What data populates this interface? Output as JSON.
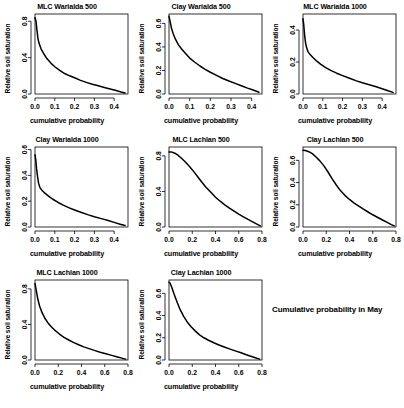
{
  "figure": {
    "caption": "Cumulative probability in May",
    "caption_position": {
      "left": 272,
      "top": 305
    },
    "width": 404,
    "height": 408,
    "background": "#ffffff",
    "line_color": "#000000",
    "axis_color": "#000000"
  },
  "common": {
    "xlabel": "cumulative probability",
    "ylabel": "Relative soil saturation"
  },
  "chart_data": [
    {
      "type": "line",
      "title": "MLC Warialda 500",
      "xlabel": "cumulative probability",
      "ylabel": "Relative soil saturation",
      "xlim": [
        0.0,
        0.47
      ],
      "ylim": [
        0.0,
        0.88
      ],
      "xticks": [
        0.0,
        0.1,
        0.2,
        0.3,
        0.4
      ],
      "xticklabels": [
        "0.0",
        "0.1",
        "0.2",
        "0.3",
        "0.4"
      ],
      "yticks": [
        0.0,
        0.4,
        0.8
      ],
      "yticklabels": [
        "0.0",
        "0.4",
        "0.8"
      ],
      "grid": false,
      "legend": "none",
      "x": [
        0.0,
        0.005,
        0.01,
        0.015,
        0.02,
        0.03,
        0.045,
        0.06,
        0.08,
        0.1,
        0.125,
        0.15,
        0.175,
        0.2,
        0.23,
        0.26,
        0.29,
        0.32,
        0.35,
        0.38,
        0.41,
        0.435,
        0.455
      ],
      "y": [
        0.84,
        0.8,
        0.7,
        0.61,
        0.56,
        0.5,
        0.44,
        0.39,
        0.34,
        0.3,
        0.26,
        0.225,
        0.2,
        0.178,
        0.15,
        0.128,
        0.108,
        0.09,
        0.072,
        0.055,
        0.038,
        0.022,
        0.012
      ]
    },
    {
      "type": "line",
      "title": "Clay Warialda 500",
      "xlabel": "cumulative probability",
      "ylabel": "Relative soil saturation",
      "xlim": [
        0.0,
        0.45
      ],
      "ylim": [
        0.0,
        0.68
      ],
      "xticks": [
        0.0,
        0.1,
        0.2,
        0.3,
        0.4
      ],
      "xticklabels": [
        "0.0",
        "0.1",
        "0.2",
        "0.3",
        "0.4"
      ],
      "yticks": [
        0.0,
        0.2,
        0.4,
        0.6
      ],
      "yticklabels": [
        "0.0",
        "0.2",
        "0.4",
        "0.6"
      ],
      "grid": false,
      "legend": "none",
      "x": [
        0.0,
        0.005,
        0.012,
        0.02,
        0.03,
        0.045,
        0.06,
        0.08,
        0.1,
        0.125,
        0.15,
        0.175,
        0.2,
        0.23,
        0.26,
        0.29,
        0.32,
        0.35,
        0.38,
        0.4,
        0.42,
        0.435
      ],
      "y": [
        0.66,
        0.62,
        0.56,
        0.515,
        0.47,
        0.42,
        0.385,
        0.345,
        0.305,
        0.27,
        0.238,
        0.21,
        0.185,
        0.158,
        0.132,
        0.11,
        0.09,
        0.07,
        0.05,
        0.038,
        0.025,
        0.015
      ]
    },
    {
      "type": "line",
      "title": "MLC Warialda 1000",
      "xlabel": "cumulative probability",
      "ylabel": "Relative soil saturation",
      "xlim": [
        0.0,
        0.47
      ],
      "ylim": [
        0.0,
        0.5
      ],
      "xticks": [
        0.0,
        0.1,
        0.2,
        0.3,
        0.4
      ],
      "xticklabels": [
        "0.0",
        "0.1",
        "0.2",
        "0.3",
        "0.4"
      ],
      "yticks": [
        0.0,
        0.2,
        0.4
      ],
      "yticklabels": [
        "0.0",
        "0.2",
        "0.4"
      ],
      "grid": false,
      "legend": "none",
      "x": [
        0.0,
        0.004,
        0.008,
        0.013,
        0.018,
        0.025,
        0.035,
        0.05,
        0.07,
        0.09,
        0.115,
        0.14,
        0.17,
        0.2,
        0.235,
        0.27,
        0.3,
        0.335,
        0.37,
        0.4,
        0.43,
        0.455
      ],
      "y": [
        0.47,
        0.43,
        0.37,
        0.32,
        0.29,
        0.265,
        0.248,
        0.228,
        0.205,
        0.185,
        0.165,
        0.148,
        0.13,
        0.115,
        0.098,
        0.082,
        0.07,
        0.058,
        0.045,
        0.033,
        0.02,
        0.01
      ]
    },
    {
      "type": "line",
      "title": "Clay Warialda 1000",
      "xlabel": "cumulative probability",
      "ylabel": "Relative soil saturation",
      "xlim": [
        0.0,
        0.47
      ],
      "ylim": [
        0.0,
        0.62
      ],
      "xticks": [
        0.0,
        0.1,
        0.2,
        0.3,
        0.4
      ],
      "xticklabels": [
        "0.0",
        "0.1",
        "0.2",
        "0.3",
        "0.4"
      ],
      "yticks": [
        0.0,
        0.2,
        0.4,
        0.6
      ],
      "yticklabels": [
        "0.0",
        "0.2",
        "0.4",
        "0.6"
      ],
      "grid": false,
      "legend": "none",
      "x": [
        0.0,
        0.004,
        0.008,
        0.013,
        0.018,
        0.025,
        0.035,
        0.05,
        0.07,
        0.09,
        0.115,
        0.14,
        0.17,
        0.2,
        0.235,
        0.27,
        0.3,
        0.335,
        0.37,
        0.4,
        0.43,
        0.455
      ],
      "y": [
        0.56,
        0.52,
        0.45,
        0.39,
        0.34,
        0.305,
        0.285,
        0.262,
        0.238,
        0.215,
        0.192,
        0.172,
        0.15,
        0.132,
        0.112,
        0.094,
        0.08,
        0.065,
        0.05,
        0.036,
        0.022,
        0.011
      ]
    },
    {
      "type": "line",
      "title": "MLC Lachlan 500",
      "xlabel": "cumulative probability",
      "ylabel": "Relative soil saturation",
      "xlim": [
        0.0,
        0.8
      ],
      "ylim": [
        0.0,
        0.9
      ],
      "xticks": [
        0.0,
        0.2,
        0.4,
        0.6,
        0.8
      ],
      "xticklabels": [
        "0.0",
        "0.2",
        "0.4",
        "0.6",
        "0.8"
      ],
      "yticks": [
        0.0,
        0.4,
        0.8
      ],
      "yticklabels": [
        "0.0",
        "0.4",
        "0.8"
      ],
      "grid": false,
      "legend": "none",
      "x": [
        0.0,
        0.02,
        0.05,
        0.08,
        0.11,
        0.145,
        0.18,
        0.215,
        0.25,
        0.285,
        0.32,
        0.36,
        0.4,
        0.44,
        0.48,
        0.52,
        0.56,
        0.6,
        0.64,
        0.68,
        0.72,
        0.76,
        0.785
      ],
      "y": [
        0.845,
        0.845,
        0.83,
        0.805,
        0.77,
        0.725,
        0.675,
        0.62,
        0.56,
        0.5,
        0.445,
        0.39,
        0.335,
        0.29,
        0.25,
        0.212,
        0.178,
        0.145,
        0.115,
        0.085,
        0.058,
        0.03,
        0.012
      ]
    },
    {
      "type": "line",
      "title": "Clay Lachlan 500",
      "xlabel": "cumulative probability",
      "ylabel": "Relative soil saturation",
      "xlim": [
        0.0,
        0.8
      ],
      "ylim": [
        0.0,
        0.72
      ],
      "xticks": [
        0.0,
        0.2,
        0.4,
        0.6,
        0.8
      ],
      "xticklabels": [
        "0.0",
        "0.2",
        "0.4",
        "0.6",
        "0.8"
      ],
      "yticks": [
        0.0,
        0.2,
        0.4,
        0.6
      ],
      "yticklabels": [
        "0.0",
        "0.2",
        "0.4",
        "0.6"
      ],
      "grid": false,
      "legend": "none",
      "x": [
        0.0,
        0.02,
        0.05,
        0.08,
        0.11,
        0.145,
        0.18,
        0.215,
        0.25,
        0.285,
        0.32,
        0.36,
        0.4,
        0.44,
        0.48,
        0.52,
        0.56,
        0.6,
        0.64,
        0.68,
        0.72,
        0.76,
        0.785
      ],
      "y": [
        0.69,
        0.688,
        0.678,
        0.66,
        0.632,
        0.595,
        0.55,
        0.495,
        0.435,
        0.38,
        0.33,
        0.285,
        0.248,
        0.215,
        0.188,
        0.16,
        0.135,
        0.11,
        0.088,
        0.065,
        0.044,
        0.022,
        0.01
      ]
    },
    {
      "type": "line",
      "title": "MLC Lachlan 1000",
      "xlabel": "cumulative probability",
      "ylabel": "Relative soil saturation",
      "xlim": [
        0.0,
        0.8
      ],
      "ylim": [
        0.0,
        0.9
      ],
      "xticks": [
        0.0,
        0.2,
        0.4,
        0.6,
        0.8
      ],
      "xticklabels": [
        "0.0",
        "0.2",
        "0.4",
        "0.6",
        "0.8"
      ],
      "yticks": [
        0.0,
        0.4,
        0.8
      ],
      "yticklabels": [
        "0.0",
        "0.4",
        "0.8"
      ],
      "grid": false,
      "legend": "none",
      "x": [
        0.0,
        0.01,
        0.025,
        0.04,
        0.06,
        0.085,
        0.11,
        0.14,
        0.175,
        0.21,
        0.25,
        0.29,
        0.33,
        0.375,
        0.42,
        0.465,
        0.51,
        0.56,
        0.61,
        0.66,
        0.71,
        0.755,
        0.78
      ],
      "y": [
        0.86,
        0.79,
        0.68,
        0.605,
        0.535,
        0.47,
        0.42,
        0.375,
        0.33,
        0.292,
        0.255,
        0.225,
        0.198,
        0.172,
        0.148,
        0.128,
        0.108,
        0.088,
        0.07,
        0.052,
        0.034,
        0.018,
        0.01
      ]
    },
    {
      "type": "line",
      "title": "Clay Lachlan 1000",
      "xlabel": "cumulative probability",
      "ylabel": "Relative soil saturation",
      "xlim": [
        0.0,
        0.8
      ],
      "ylim": [
        0.0,
        0.72
      ],
      "xticks": [
        0.0,
        0.2,
        0.4,
        0.6,
        0.8
      ],
      "xticklabels": [
        "0.0",
        "0.2",
        "0.4",
        "0.6",
        "0.8"
      ],
      "yticks": [
        0.0,
        0.2,
        0.4,
        0.6
      ],
      "yticklabels": [
        "0.0",
        "0.2",
        "0.4",
        "0.6"
      ],
      "grid": false,
      "legend": "none",
      "x": [
        0.0,
        0.01,
        0.025,
        0.045,
        0.07,
        0.095,
        0.125,
        0.155,
        0.19,
        0.225,
        0.26,
        0.3,
        0.34,
        0.385,
        0.43,
        0.475,
        0.52,
        0.57,
        0.62,
        0.665,
        0.71,
        0.755,
        0.78
      ],
      "y": [
        0.7,
        0.69,
        0.65,
        0.59,
        0.52,
        0.455,
        0.395,
        0.345,
        0.3,
        0.262,
        0.228,
        0.2,
        0.178,
        0.155,
        0.135,
        0.117,
        0.1,
        0.082,
        0.065,
        0.048,
        0.032,
        0.016,
        0.008
      ]
    }
  ],
  "panel_layout": [
    {
      "left": 0,
      "top": 0
    },
    {
      "left": 134,
      "top": 0
    },
    {
      "left": 268,
      "top": 0
    },
    {
      "left": 0,
      "top": 133
    },
    {
      "left": 134,
      "top": 133
    },
    {
      "left": 268,
      "top": 133
    },
    {
      "left": 0,
      "top": 266
    },
    {
      "left": 134,
      "top": 266
    }
  ]
}
